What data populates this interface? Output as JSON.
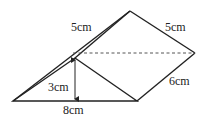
{
  "diagram": {
    "labels": {
      "slant_front": "5cm",
      "slant_back": "5cm",
      "length": "6cm",
      "height": "3cm",
      "base": "8cm"
    },
    "colors": {
      "stroke": "#222222",
      "dashed": "#555555",
      "background": "#ffffff"
    }
  }
}
